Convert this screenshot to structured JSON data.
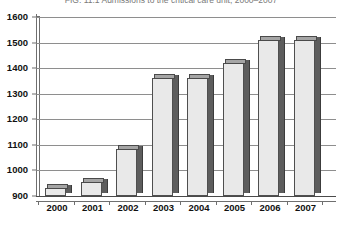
{
  "figure": {
    "title": "FIG. 11.1  Admissions to the critical care unit, 2000–2007"
  },
  "chart_data": {
    "type": "bar",
    "title": "FIG. 11.1  Admissions to the critical care unit, 2000–2007",
    "xlabel": "",
    "ylabel": "",
    "categories": [
      "2000",
      "2001",
      "2002",
      "2003",
      "2004",
      "2005",
      "2006",
      "2007"
    ],
    "values": [
      930,
      955,
      1085,
      1360,
      1360,
      1420,
      1510,
      1510
    ],
    "ylim": [
      900,
      1600
    ],
    "yticks": [
      900,
      1000,
      1100,
      1200,
      1300,
      1400,
      1500,
      1600
    ],
    "ytick_labels": [
      "900",
      "1000",
      "1100",
      "1200",
      "1300",
      "1400",
      "1500",
      "1600"
    ],
    "grid": true,
    "legend": false,
    "style": "3d-column",
    "colors": {
      "bar_face": "#e9e9e9",
      "bar_side": "#5d5d5d",
      "bar_top": "#9b9b9b",
      "bar_outline": "#4f4f4f",
      "gridline": "#8e8e8e",
      "axis": "#6f6f6f",
      "text": "#111111",
      "background": "#ffffff"
    }
  }
}
